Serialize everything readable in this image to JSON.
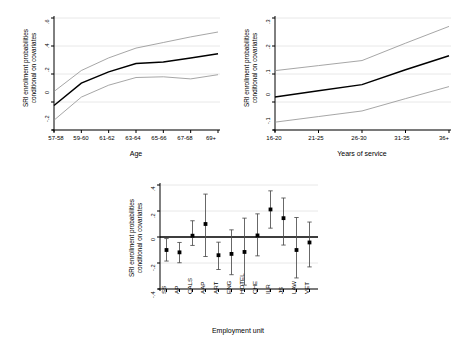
{
  "figure": {
    "background": "#ffffff",
    "line_color": "#000000",
    "ci_color": "#8f8f8f",
    "grid_color": "#e8e8e8"
  },
  "chart_data": [
    {
      "id": "age-panel",
      "type": "line",
      "title": "",
      "xlabel": "Age",
      "ylabel": "SRI enrollment probabilities conditional on covariates",
      "ylabel_lines": [
        "SRI enrollment probabilities",
        "conditional on covariates"
      ],
      "categories": [
        "57-58",
        "59-60",
        "61-62",
        "63-64",
        "65-66",
        "67-68",
        "69+"
      ],
      "ytick_labels": [
        "-.2",
        "0",
        ".2",
        ".4",
        ".6"
      ],
      "ytick_values": [
        -0.2,
        0,
        0.2,
        0.4,
        0.6
      ],
      "ylim": [
        -0.2,
        0.6
      ],
      "grid": true,
      "legend": "none",
      "series": [
        {
          "name": "point estimate",
          "role": "main",
          "values": [
            -0.025,
            0.135,
            0.215,
            0.275,
            0.285,
            0.315,
            0.345
          ]
        },
        {
          "name": "upper confidence limit",
          "role": "ci_upper",
          "values": [
            0.075,
            0.225,
            0.315,
            0.385,
            0.425,
            0.465,
            0.5
          ]
        },
        {
          "name": "lower confidence limit",
          "role": "ci_lower",
          "values": [
            -0.13,
            0.035,
            0.12,
            0.175,
            0.18,
            0.165,
            0.195
          ]
        }
      ]
    },
    {
      "id": "service-panel",
      "type": "line",
      "title": "",
      "xlabel": "Years of service",
      "ylabel": "SRI enrollment probabilities conditional on covariates",
      "ylabel_lines": [
        "SRI enrollment probabilities",
        "conditional on covariates"
      ],
      "categories": [
        "16-20",
        "21-25",
        "26-30",
        "31-35",
        "36+"
      ],
      "ytick_labels": [
        "-.1",
        "0",
        ".1",
        ".2",
        ".3"
      ],
      "ytick_values": [
        -0.1,
        0,
        0.1,
        0.2,
        0.3
      ],
      "ylim": [
        -0.1,
        0.3
      ],
      "grid": true,
      "legend": "none",
      "series": [
        {
          "name": "point estimate",
          "role": "main",
          "values": [
            0.018,
            0.04,
            0.062,
            0.115,
            0.165
          ]
        },
        {
          "name": "upper confidence limit",
          "role": "ci_upper",
          "values": [
            0.112,
            0.13,
            0.148,
            0.21,
            0.27
          ]
        },
        {
          "name": "lower confidence limit",
          "role": "ci_lower",
          "values": [
            -0.072,
            -0.052,
            -0.032,
            0.012,
            0.055
          ]
        }
      ]
    },
    {
      "id": "unit-panel",
      "type": "scatter",
      "title": "",
      "xlabel": "Employment unit",
      "ylabel": "SRI enrollment probabilities conditional on covariates",
      "ylabel_lines": [
        "SRI enrollment probabilities",
        "conditional on covariates"
      ],
      "categories": [
        "SS",
        "AP",
        "CALS",
        "AAP",
        "ART",
        "ENG",
        "HOTEL",
        "CHE",
        "ILR",
        "JS",
        "LAW",
        "VET"
      ],
      "ytick_labels": [
        "-.4",
        "-.2",
        "0",
        ".2",
        ".4"
      ],
      "ytick_values": [
        -0.4,
        -0.2,
        0,
        0.2,
        0.4
      ],
      "ylim": [
        -0.4,
        0.4
      ],
      "grid": true,
      "legend": "none",
      "reference_line": 0,
      "values": [
        -0.1,
        -0.118,
        0.01,
        0.1,
        -0.14,
        -0.13,
        -0.115,
        0.012,
        0.212,
        0.145,
        -0.1,
        -0.042
      ],
      "ci_lower": [
        -0.185,
        -0.198,
        -0.065,
        -0.15,
        -0.25,
        -0.29,
        -0.37,
        -0.145,
        0.068,
        -0.062,
        -0.315,
        -0.23
      ],
      "ci_upper": [
        -0.012,
        -0.042,
        0.125,
        0.33,
        -0.04,
        0.055,
        0.145,
        0.178,
        0.355,
        0.3,
        0.15,
        0.115
      ]
    }
  ]
}
